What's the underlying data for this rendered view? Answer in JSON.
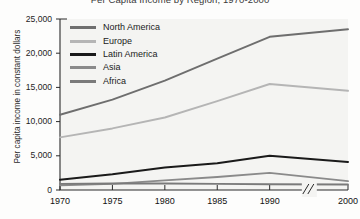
{
  "chart_data": {
    "type": "line",
    "title": "Per Capita Income by Region, 1970-2000",
    "xlabel": "",
    "ylabel": "Per capita income in constant dollars",
    "x": [
      1970,
      1975,
      1980,
      1985,
      1990,
      2000
    ],
    "xtick_labels": [
      "1970",
      "1975",
      "1980",
      "1985",
      "1990",
      "2000"
    ],
    "ytick_labels": [
      "0",
      "5,000",
      "10,000",
      "15,000",
      "20,000",
      "25,000"
    ],
    "yticks": [
      0,
      5000,
      10000,
      15000,
      20000,
      25000
    ],
    "ylim": [
      0,
      25000
    ],
    "grid": false,
    "legend_position": "upper-left-inside",
    "axis_break": {
      "present": true,
      "between": [
        "1990",
        "2000"
      ],
      "glyph": "//"
    },
    "series": [
      {
        "name": "North America",
        "color": "#6e6e6e",
        "values": [
          11000,
          13200,
          16000,
          19200,
          22400,
          23500
        ]
      },
      {
        "name": "Europe",
        "color": "#b5b5b5",
        "values": [
          7700,
          9000,
          10600,
          13000,
          15500,
          14500
        ]
      },
      {
        "name": "Latin America",
        "color": "#1a1a1a",
        "values": [
          1500,
          2300,
          3300,
          3900,
          5000,
          4100
        ]
      },
      {
        "name": "Asia",
        "color": "#8a8a8a",
        "values": [
          700,
          900,
          1400,
          1900,
          2500,
          1300
        ]
      },
      {
        "name": "Africa",
        "color": "#7a7a7a",
        "values": [
          900,
          950,
          950,
          900,
          850,
          800
        ]
      }
    ]
  }
}
